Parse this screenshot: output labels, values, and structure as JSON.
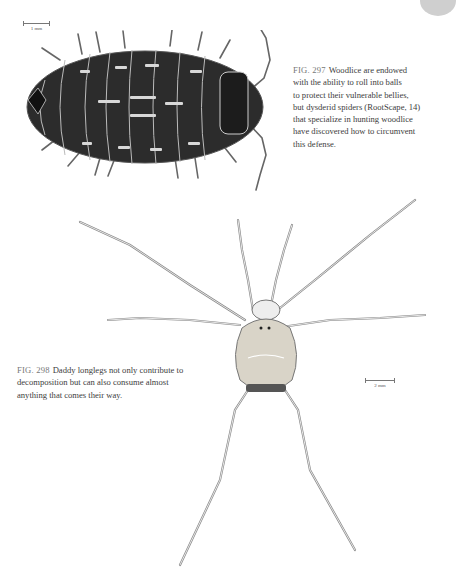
{
  "page": {
    "figures": [
      {
        "id": "fig-297",
        "label": "FIG. 297",
        "caption": "Woodlice are endowed with the ability to roll into balls to protect their vulnerable bellies, but dysderid spiders (RootScape, 14) that specialize in hunting woodlice have discovered how to circumvent this defense.",
        "caption_lines": [
          "Woodlice are endowed",
          "with the ability to roll into balls",
          "to protect their vulnerable bellies,",
          "but dysderid spiders (RootScape, 14)",
          "that specialize in hunting woodlice",
          "have discovered how to circumvent",
          "this defense."
        ],
        "scale_bar": "1 mm",
        "subject": "woodlouse illustration"
      },
      {
        "id": "fig-298",
        "label": "FIG. 298",
        "caption": "Daddy longlegs not only contribute to decomposition but can also consume almost anything that comes their way.",
        "caption_lines": [
          "Daddy longlegs not only contribute to",
          "decomposition but can also consume almost",
          "anything that comes their way."
        ],
        "scale_bar": "2 mm",
        "subject": "daddy longlegs illustration"
      }
    ],
    "colors": {
      "text": "#3d3d3d",
      "fig_label": "#777777",
      "tab": "#cfcfcf"
    }
  }
}
